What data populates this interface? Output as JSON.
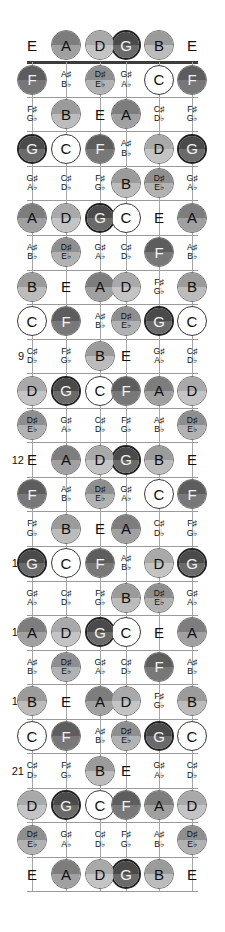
{
  "diagram": {
    "type": "guitar-fretboard",
    "tuning": [
      "E",
      "A",
      "D",
      "G",
      "B",
      "E"
    ],
    "fret_count": 24,
    "marker_frets": [
      5,
      7,
      9,
      12,
      15,
      17,
      19,
      21
    ],
    "string_count": 6
  },
  "palette": {
    "C": {
      "top": "#d8d8d8",
      "bottom": "#ffffff",
      "mode": "ring"
    },
    "C#": {
      "top": "#c2c2c2",
      "bottom": "#d6d6d6",
      "mode": "none"
    },
    "D": {
      "top": "#a9a9a9",
      "bottom": "#c4c4c4",
      "mode": "fill"
    },
    "D#": {
      "top": "#8e8e8e",
      "bottom": "#b2b2b2",
      "mode": "fill"
    },
    "E": {
      "top": "#ffffff",
      "bottom": "#ffffff",
      "mode": "none"
    },
    "F": {
      "top": "#5d5d5d",
      "bottom": "#787878",
      "mode": "fill"
    },
    "F#": {
      "top": "#ffffff",
      "bottom": "#ffffff",
      "mode": "none"
    },
    "G": {
      "top": "#4a4a4a",
      "bottom": "#6a6a6a",
      "mode": "fill"
    },
    "G#": {
      "top": "#ffffff",
      "bottom": "#ffffff",
      "mode": "none"
    },
    "A": {
      "top": "#7d7d7d",
      "bottom": "#a0a0a0",
      "mode": "fill"
    },
    "A#": {
      "top": "#ffffff",
      "bottom": "#ffffff",
      "mode": "none"
    },
    "B": {
      "top": "#9b9b9b",
      "bottom": "#bcbcbc",
      "mode": "fill"
    }
  },
  "note_names": {
    "C": "C",
    "D": "D",
    "E": "E",
    "F": "F",
    "G": "G",
    "A": "A",
    "B": "B",
    "C#": [
      "C♯",
      "D♭"
    ],
    "D#": [
      "D♯",
      "E♭"
    ],
    "F#": [
      "F♯",
      "G♭"
    ],
    "G#": [
      "G♯",
      "A♭"
    ],
    "A#": [
      "A♯",
      "B♭"
    ]
  },
  "rows": [
    {
      "fret": 0,
      "label": "",
      "notes": [
        "E",
        "A",
        "D",
        "G",
        "B",
        "E"
      ]
    },
    {
      "fret": 1,
      "label": "",
      "notes": [
        "F",
        "A#",
        "D#",
        "G#",
        "C",
        "F"
      ]
    },
    {
      "fret": 2,
      "label": "",
      "notes": [
        "F#",
        "B",
        "E",
        "A",
        "C#",
        "F#"
      ]
    },
    {
      "fret": 3,
      "label": "",
      "notes": [
        "G",
        "C",
        "F",
        "A#",
        "D",
        "G"
      ]
    },
    {
      "fret": 4,
      "label": "",
      "notes": [
        "G#",
        "C#",
        "F#",
        "B",
        "D#",
        "G#"
      ]
    },
    {
      "fret": 5,
      "label": "5",
      "notes": [
        "A",
        "D",
        "G",
        "C",
        "E",
        "A"
      ]
    },
    {
      "fret": 6,
      "label": "",
      "notes": [
        "A#",
        "D#",
        "G#",
        "C#",
        "F",
        "A#"
      ]
    },
    {
      "fret": 7,
      "label": "7",
      "notes": [
        "B",
        "E",
        "A",
        "D",
        "F#",
        "B"
      ]
    },
    {
      "fret": 8,
      "label": "",
      "notes": [
        "C",
        "F",
        "A#",
        "D#",
        "G",
        "C"
      ]
    },
    {
      "fret": 9,
      "label": "9",
      "notes": [
        "C#",
        "F#",
        "B",
        "E",
        "G#",
        "C#"
      ]
    },
    {
      "fret": 10,
      "label": "",
      "notes": [
        "D",
        "G",
        "C",
        "F",
        "A",
        "D"
      ]
    },
    {
      "fret": 11,
      "label": "",
      "notes": [
        "D#",
        "G#",
        "C#",
        "F#",
        "A#",
        "D#"
      ]
    },
    {
      "fret": 12,
      "label": "12",
      "notes": [
        "E",
        "A",
        "D",
        "G",
        "B",
        "E"
      ]
    },
    {
      "fret": 13,
      "label": "",
      "notes": [
        "F",
        "A#",
        "D#",
        "G#",
        "C",
        "F"
      ]
    },
    {
      "fret": 14,
      "label": "",
      "notes": [
        "F#",
        "B",
        "E",
        "A",
        "C#",
        "F#"
      ]
    },
    {
      "fret": 15,
      "label": "15",
      "notes": [
        "G",
        "C",
        "F",
        "A#",
        "D",
        "G"
      ]
    },
    {
      "fret": 16,
      "label": "",
      "notes": [
        "G#",
        "C#",
        "F#",
        "B",
        "D#",
        "G#"
      ]
    },
    {
      "fret": 17,
      "label": "17",
      "notes": [
        "A",
        "D",
        "G",
        "C",
        "E",
        "A"
      ]
    },
    {
      "fret": 18,
      "label": "",
      "notes": [
        "A#",
        "D#",
        "G#",
        "C#",
        "F",
        "A#"
      ]
    },
    {
      "fret": 19,
      "label": "19",
      "notes": [
        "B",
        "E",
        "A",
        "D",
        "F#",
        "B"
      ]
    },
    {
      "fret": 20,
      "label": "",
      "notes": [
        "C",
        "F",
        "A#",
        "D#",
        "G",
        "C"
      ]
    },
    {
      "fret": 21,
      "label": "21",
      "notes": [
        "C#",
        "F#",
        "B",
        "E",
        "G#",
        "C#"
      ]
    },
    {
      "fret": 22,
      "label": "",
      "notes": [
        "D",
        "G",
        "C",
        "F",
        "A",
        "D"
      ]
    },
    {
      "fret": 23,
      "label": "",
      "notes": [
        "D#",
        "G#",
        "C#",
        "F#",
        "A#",
        "D#"
      ]
    },
    {
      "fret": 24,
      "label": "",
      "notes": [
        "E",
        "A",
        "D",
        "G",
        "B",
        "E"
      ]
    }
  ],
  "highlight": {
    "note": "G",
    "description": "G notes drawn with a heavier outline ring"
  },
  "geometry": {
    "left": 27,
    "right": 198,
    "row0_y": 45,
    "row_step": 34.6,
    "string_xs": [
      32,
      66,
      100,
      125,
      158,
      192
    ]
  }
}
